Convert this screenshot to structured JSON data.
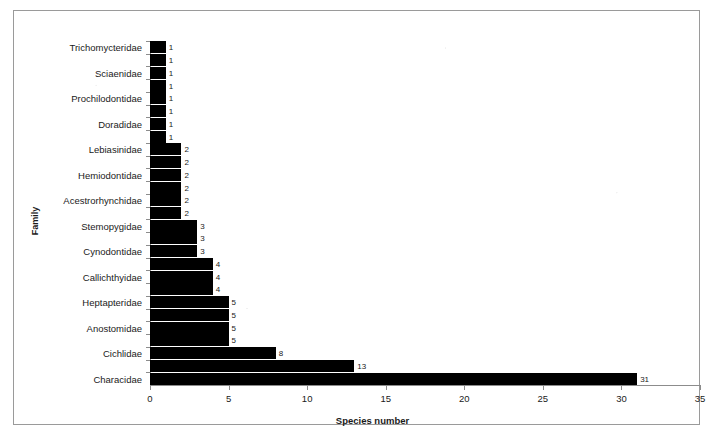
{
  "chart_data": {
    "type": "bar",
    "orientation": "horizontal",
    "title": "",
    "xlabel": "Species number",
    "ylabel": "Family",
    "xlim": [
      0,
      35
    ],
    "xticks": [
      0,
      5,
      10,
      15,
      20,
      25,
      30,
      35
    ],
    "grid": false,
    "legend": null,
    "bar_color": "#000000",
    "categories": [
      "Trichomycteridae",
      "",
      "Sciaenidae",
      "",
      "Prochilodontidae",
      "",
      "Doradidae",
      "",
      "Lebiasinidae",
      "",
      "Hemiodontidae",
      "",
      "Acestrorhynchidae",
      "",
      "Stemopygidae",
      "",
      "Cynodontidae",
      "",
      "Callichthyidae",
      "",
      "Heptapteridae",
      "",
      "Anostomidae",
      "",
      "Cichlidae",
      "",
      "Characidae"
    ],
    "visible_category_labels": [
      "Trichomycteridae",
      "Sciaenidae",
      "Prochilodontidae",
      "Doradidae",
      "Lebiasinidae",
      "Hemiodontidae",
      "Acestrorhynchidae",
      "Stemopygidae",
      "Cynodontidae",
      "Callichthyidae",
      "Heptapteridae",
      "Anostomidae",
      "Cichlidae",
      "Characidae"
    ],
    "values": [
      1,
      1,
      1,
      1,
      1,
      1,
      1,
      1,
      2,
      2,
      2,
      2,
      2,
      2,
      3,
      3,
      3,
      4,
      4,
      4,
      5,
      5,
      5,
      5,
      8,
      13,
      31
    ],
    "data_labels": [
      "1",
      "1",
      "1",
      "1",
      "1",
      "1",
      "1",
      "1",
      "2",
      "2",
      "2",
      "2",
      "2",
      "2",
      "3",
      "3",
      "3",
      "4",
      "4",
      "4",
      "5",
      "5",
      "5",
      "5",
      "8",
      "13",
      "31"
    ]
  },
  "axes": {
    "x_title": "Species number",
    "y_title": "Family",
    "x_tick_labels": [
      "0",
      "5",
      "10",
      "15",
      "20",
      "25",
      "30",
      "35"
    ]
  },
  "colors": {
    "bar": "#000000",
    "axis": "#8c8c8c",
    "frame": "#9a9a9a",
    "text": "#1a1a1a",
    "background": "#ffffff"
  }
}
